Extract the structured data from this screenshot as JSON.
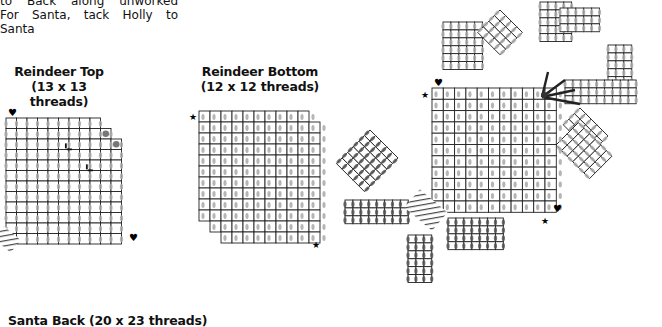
{
  "intro_text": {
    "line1": "to Back along unworked",
    "line2": "For Santa, tack Holly to Santa"
  },
  "pieces": {
    "reindeer_top": {
      "title": "Reindeer Top",
      "size": "(13 x 13 threads)"
    },
    "reindeer_bottom": {
      "title": "Reindeer Bottom",
      "size": "(12 x 12 threads)"
    },
    "santa_back": {
      "title": "Santa Back (20 x 23 threads)"
    }
  },
  "markers": {
    "heart": "♥",
    "star": "★"
  },
  "colors": {
    "grid_line": "#222222",
    "stitch_light": "#a8a8a8",
    "stitch_dark": "#555555",
    "accent_dot": "#777777",
    "hatch": "#444444"
  }
}
